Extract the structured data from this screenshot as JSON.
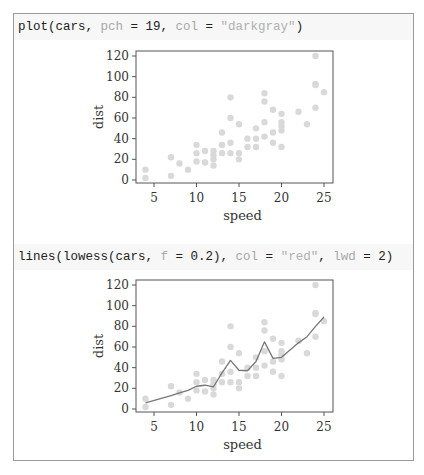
{
  "code_blocks": [
    {
      "tokens": [
        {
          "t": "plot(cars, ",
          "c": "fn"
        },
        {
          "t": "pch",
          "c": "kw"
        },
        {
          "t": " = ",
          "c": "op"
        },
        {
          "t": "19",
          "c": "num"
        },
        {
          "t": ", ",
          "c": "op"
        },
        {
          "t": "col",
          "c": "kw"
        },
        {
          "t": " = ",
          "c": "op"
        },
        {
          "t": "\"darkgray\"",
          "c": "str"
        },
        {
          "t": ")",
          "c": "op"
        }
      ]
    },
    {
      "tokens": [
        {
          "t": "lines(lowess(cars, ",
          "c": "fn"
        },
        {
          "t": "f",
          "c": "kw"
        },
        {
          "t": " = ",
          "c": "op"
        },
        {
          "t": "0.2",
          "c": "num"
        },
        {
          "t": "), ",
          "c": "op"
        },
        {
          "t": "col",
          "c": "kw"
        },
        {
          "t": " = ",
          "c": "op"
        },
        {
          "t": "\"red\"",
          "c": "str"
        },
        {
          "t": ", ",
          "c": "op"
        },
        {
          "t": "lwd",
          "c": "kw"
        },
        {
          "t": " = ",
          "c": "op"
        },
        {
          "t": "2",
          "c": "num"
        },
        {
          "t": ")",
          "c": "op"
        }
      ]
    }
  ],
  "colors": {
    "points": "#d9d9d9",
    "line": "#777777",
    "axis": "#555555",
    "text": "#333333"
  },
  "chart_data": [
    {
      "type": "scatter",
      "title": "",
      "xlabel": "speed",
      "ylabel": "dist",
      "xlim": [
        4,
        25
      ],
      "ylim": [
        0,
        120
      ],
      "xticks": [
        5,
        10,
        15,
        20,
        25
      ],
      "yticks": [
        0,
        20,
        40,
        60,
        80,
        100,
        120
      ],
      "grid": false,
      "series": [
        {
          "name": "cars",
          "x": [
            4,
            4,
            7,
            7,
            8,
            9,
            10,
            10,
            10,
            11,
            11,
            12,
            12,
            12,
            12,
            13,
            13,
            13,
            13,
            14,
            14,
            14,
            14,
            15,
            15,
            15,
            16,
            16,
            17,
            17,
            17,
            18,
            18,
            18,
            18,
            19,
            19,
            19,
            20,
            20,
            20,
            20,
            20,
            22,
            23,
            24,
            24,
            24,
            24,
            25
          ],
          "y": [
            2,
            10,
            4,
            22,
            16,
            10,
            18,
            26,
            34,
            17,
            28,
            14,
            20,
            24,
            28,
            26,
            34,
            34,
            46,
            26,
            36,
            60,
            80,
            20,
            26,
            54,
            32,
            40,
            32,
            40,
            50,
            42,
            56,
            76,
            84,
            36,
            46,
            68,
            32,
            48,
            52,
            56,
            64,
            66,
            54,
            70,
            92,
            93,
            120,
            85
          ]
        }
      ]
    },
    {
      "type": "line",
      "title": "",
      "xlabel": "speed",
      "ylabel": "dist",
      "xlim": [
        4,
        25
      ],
      "ylim": [
        0,
        120
      ],
      "xticks": [
        5,
        10,
        15,
        20,
        25
      ],
      "yticks": [
        0,
        20,
        40,
        60,
        80,
        100,
        120
      ],
      "grid": false,
      "series": [
        {
          "name": "cars",
          "kind": "points",
          "x": [
            4,
            4,
            7,
            7,
            8,
            9,
            10,
            10,
            10,
            11,
            11,
            12,
            12,
            12,
            12,
            13,
            13,
            13,
            13,
            14,
            14,
            14,
            14,
            15,
            15,
            15,
            16,
            16,
            17,
            17,
            17,
            18,
            18,
            18,
            18,
            19,
            19,
            19,
            20,
            20,
            20,
            20,
            20,
            22,
            23,
            24,
            24,
            24,
            24,
            25
          ],
          "y": [
            2,
            10,
            4,
            22,
            16,
            10,
            18,
            26,
            34,
            17,
            28,
            14,
            20,
            24,
            28,
            26,
            34,
            34,
            46,
            26,
            36,
            60,
            80,
            20,
            26,
            54,
            32,
            40,
            32,
            40,
            50,
            42,
            56,
            76,
            84,
            36,
            46,
            68,
            32,
            48,
            52,
            56,
            64,
            66,
            54,
            70,
            92,
            93,
            120,
            85
          ]
        },
        {
          "name": "lowess(cars, f = 0.2)",
          "kind": "line",
          "x": [
            4,
            7,
            8,
            9,
            10,
            11,
            12,
            13,
            14,
            15,
            16,
            17,
            18,
            19,
            20,
            22,
            23,
            24,
            25
          ],
          "y": [
            6,
            13,
            15.5,
            18,
            22,
            23,
            21.5,
            35,
            47,
            37.5,
            37,
            46,
            65,
            49,
            50,
            64,
            70,
            80,
            89
          ]
        }
      ]
    }
  ]
}
